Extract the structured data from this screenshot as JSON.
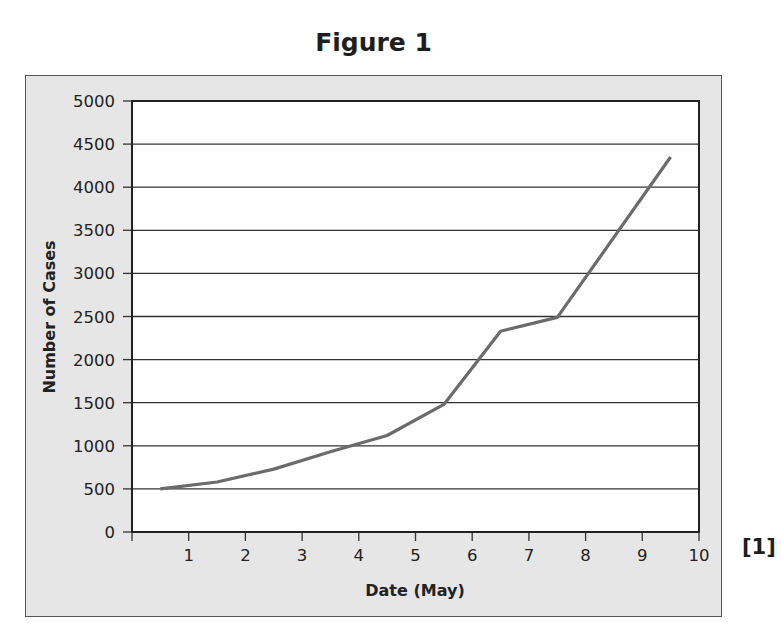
{
  "figure": {
    "title": "Figure 1",
    "marks": "[1]"
  },
  "chart_data": {
    "type": "line",
    "title": "Figure 1",
    "xlabel": "Date (May)",
    "ylabel": "Number of Cases",
    "xlim": [
      0,
      10
    ],
    "ylim": [
      0,
      5000
    ],
    "x_ticks": [
      1,
      2,
      3,
      4,
      5,
      6,
      7,
      8,
      9,
      10
    ],
    "y_ticks": [
      0,
      500,
      1000,
      1500,
      2000,
      2500,
      3000,
      3500,
      4000,
      4500,
      5000
    ],
    "grid": "horizontal",
    "legend": null,
    "series": [
      {
        "name": "Number of Cases",
        "color": "#6b6b6b",
        "x": [
          0.5,
          1.5,
          2.5,
          3.5,
          4.5,
          5.5,
          6.5,
          7.5,
          8.5,
          9.5
        ],
        "values": [
          500,
          580,
          730,
          930,
          1120,
          1480,
          2330,
          2490,
          3420,
          4350
        ]
      }
    ]
  },
  "colors": {
    "frame_bg": "#e6e6e6",
    "plot_bg": "#ffffff",
    "line": "#6b6b6b",
    "axis": "#222222"
  }
}
